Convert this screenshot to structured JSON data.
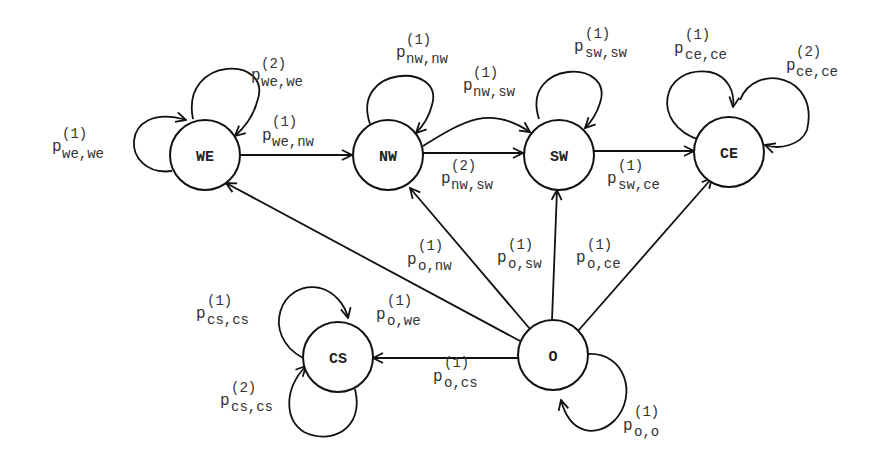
{
  "diagram": {
    "type": "state-transition",
    "nodes": [
      {
        "id": "we",
        "label": "WE"
      },
      {
        "id": "nw",
        "label": "NW"
      },
      {
        "id": "sw",
        "label": "SW"
      },
      {
        "id": "ce",
        "label": "CE"
      },
      {
        "id": "cs",
        "label": "CS"
      },
      {
        "id": "o",
        "label": "O"
      }
    ],
    "edges": [
      {
        "from": "we",
        "to": "we",
        "p": "p",
        "sup": "(1)",
        "sub": "we,we"
      },
      {
        "from": "we",
        "to": "we",
        "p": "p",
        "sup": "(2)",
        "sub": "we,we"
      },
      {
        "from": "we",
        "to": "nw",
        "p": "p",
        "sup": "(1)",
        "sub": "we,nw"
      },
      {
        "from": "nw",
        "to": "nw",
        "p": "p",
        "sup": "(1)",
        "sub": "nw,nw"
      },
      {
        "from": "nw",
        "to": "sw",
        "p": "p",
        "sup": "(1)",
        "sub": "nw,sw"
      },
      {
        "from": "nw",
        "to": "sw",
        "p": "p",
        "sup": "(2)",
        "sub": "nw,sw"
      },
      {
        "from": "sw",
        "to": "sw",
        "p": "p",
        "sup": "(1)",
        "sub": "sw,sw"
      },
      {
        "from": "sw",
        "to": "ce",
        "p": "p",
        "sup": "(1)",
        "sub": "sw,ce"
      },
      {
        "from": "ce",
        "to": "ce",
        "p": "p",
        "sup": "(1)",
        "sub": "ce,ce"
      },
      {
        "from": "ce",
        "to": "ce",
        "p": "p",
        "sup": "(2)",
        "sub": "ce,ce"
      },
      {
        "from": "o",
        "to": "nw",
        "p": "p",
        "sup": "(1)",
        "sub": "o,nw"
      },
      {
        "from": "o",
        "to": "sw",
        "p": "p",
        "sup": "(1)",
        "sub": "o,sw"
      },
      {
        "from": "o",
        "to": "ce",
        "p": "p",
        "sup": "(1)",
        "sub": "o,ce"
      },
      {
        "from": "o",
        "to": "we",
        "p": "p",
        "sup": "(1)",
        "sub": "o,we"
      },
      {
        "from": "o",
        "to": "cs",
        "p": "p",
        "sup": "(1)",
        "sub": "o,cs"
      },
      {
        "from": "o",
        "to": "o",
        "p": "p",
        "sup": "(1)",
        "sub": "o,o"
      },
      {
        "from": "cs",
        "to": "cs",
        "p": "p",
        "sup": "(1)",
        "sub": "cs,cs"
      },
      {
        "from": "cs",
        "to": "cs",
        "p": "p",
        "sup": "(2)",
        "sub": "cs,cs"
      }
    ]
  }
}
